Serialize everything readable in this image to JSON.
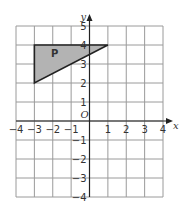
{
  "diagram": {
    "type": "coordinate-grid",
    "x_axis_label": "x",
    "y_axis_label": "y",
    "origin_label": "O",
    "x_range": [
      -4,
      4
    ],
    "y_range": [
      -4,
      5
    ],
    "x_ticks": [
      "-4",
      "-3",
      "-2",
      "-1",
      "1",
      "2",
      "3",
      "4"
    ],
    "y_ticks": [
      "5",
      "4",
      "3",
      "2",
      "1",
      "-1",
      "-2",
      "-3",
      "-4"
    ],
    "shape": {
      "label": "P",
      "vertices": [
        [
          -3,
          4
        ],
        [
          1,
          4
        ],
        [
          -3,
          2
        ]
      ],
      "fill": "#b3b3b3",
      "stroke": "#222222"
    },
    "grid_color": "#9a9a9a",
    "axis_color": "#222222"
  }
}
